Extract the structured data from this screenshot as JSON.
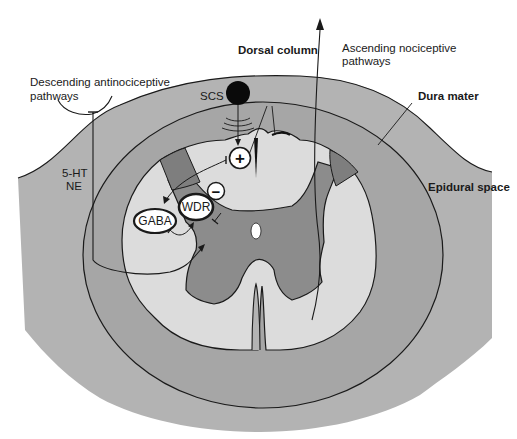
{
  "diagram": {
    "colors": {
      "background": "#ffffff",
      "epidural_space": "#b3b3b3",
      "dura_ring": "#a8a8a8",
      "white_matter": "#dcdcdc",
      "gray_matter": "#8c8c8c",
      "dorsal_horn_dark": "#7e7e7e",
      "outline": "#1a1a1a",
      "electrode": "#0a0a0a",
      "node_fill": "#ffffff"
    },
    "labels": {
      "dorsal_column": "Dorsal column",
      "ascending": [
        "Ascending nociceptive",
        "pathways"
      ],
      "descending": [
        "Descending antinociceptive",
        "pathways"
      ],
      "dura_mater": "Dura mater",
      "epidural_space": "Epidural space",
      "scs": "SCS",
      "neurotransmitters": [
        "5-HT",
        "NE"
      ]
    },
    "nodes": {
      "wdr": "WDR",
      "gaba": "GABA",
      "plus": "+",
      "minus": "−"
    }
  }
}
